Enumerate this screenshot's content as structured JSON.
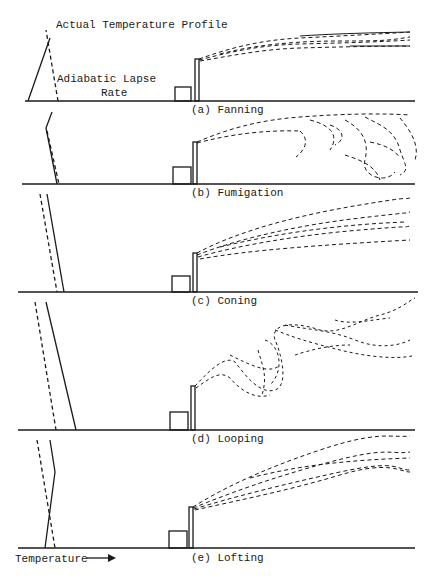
{
  "figure": {
    "legend": {
      "actual_profile": "Actual Temperature Profile",
      "adiabatic_line1": "Adiabatic Lapse",
      "adiabatic_line2": "Rate"
    },
    "x_axis_label": "Temperature",
    "x_axis_arrow": "→",
    "panels": [
      {
        "id": "a",
        "label": "(a)  Fanning",
        "ground_y": 101,
        "label_y": 104
      },
      {
        "id": "b",
        "label": "(b)  Fumigation",
        "ground_y": 184,
        "label_y": 187
      },
      {
        "id": "c",
        "label": "(c)  Coning",
        "ground_y": 292,
        "label_y": 295
      },
      {
        "id": "d",
        "label": "(d)  Looping",
        "ground_y": 430,
        "label_y": 433
      },
      {
        "id": "e",
        "label": "(e)  Lofting",
        "ground_y": 548,
        "label_y": 552
      }
    ],
    "colors": {
      "ink": "#1a1a1a",
      "background": "#ffffff"
    }
  }
}
